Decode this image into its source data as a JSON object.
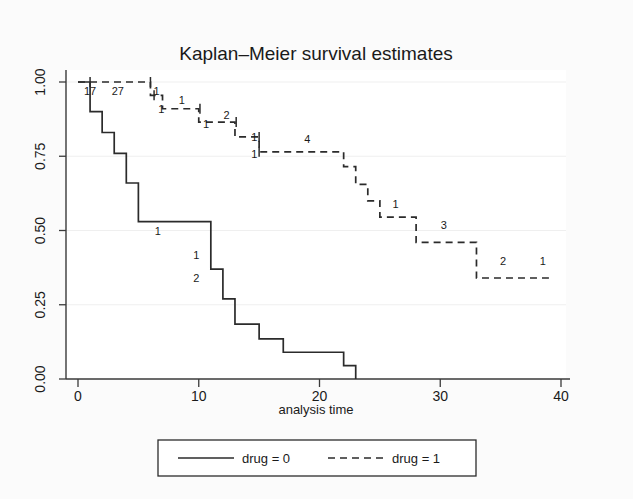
{
  "figure": {
    "background_color": "#fbfbfb",
    "plot_background_color": "#ffffff",
    "line_color": "#2b2b2b"
  },
  "chart_data": {
    "type": "line",
    "subtype": "kaplan-meier-step",
    "title": "Kaplan–Meier survival estimates",
    "xlabel": "analysis time",
    "ylabel": "",
    "xlim": [
      0,
      40
    ],
    "ylim": [
      0,
      1
    ],
    "xticks": [
      0,
      10,
      20,
      30,
      40
    ],
    "xticklabels": [
      "0",
      "10",
      "20",
      "30",
      "40"
    ],
    "yticks": [
      0.0,
      0.25,
      0.5,
      0.75,
      1.0
    ],
    "yticklabels": [
      "0.00",
      "0.25",
      "0.50",
      "0.75",
      "1.00"
    ],
    "grid": "horizontal",
    "legend_position": "below-axes",
    "series": [
      {
        "name": "drug = 0",
        "linestyle": "solid",
        "x": [
          0,
          1,
          1,
          2,
          2,
          3,
          3,
          4,
          4,
          5,
          5,
          8,
          8,
          11,
          11,
          12,
          12,
          13,
          13,
          15,
          15,
          17,
          17,
          22,
          22,
          23,
          23
        ],
        "y": [
          1.0,
          1.0,
          0.9,
          0.9,
          0.83,
          0.83,
          0.76,
          0.76,
          0.66,
          0.66,
          0.53,
          0.53,
          0.53,
          0.53,
          0.37,
          0.37,
          0.27,
          0.27,
          0.185,
          0.185,
          0.135,
          0.135,
          0.09,
          0.09,
          0.045,
          0.045,
          0.0
        ],
        "steps": [
          {
            "t": 1,
            "survival": 0.9
          },
          {
            "t": 2,
            "survival": 0.83
          },
          {
            "t": 3,
            "survival": 0.76
          },
          {
            "t": 4,
            "survival": 0.66
          },
          {
            "t": 5,
            "survival": 0.53
          },
          {
            "t": 8,
            "survival": 0.53
          },
          {
            "t": 11,
            "survival": 0.37
          },
          {
            "t": 12,
            "survival": 0.27
          },
          {
            "t": 13,
            "survival": 0.185
          },
          {
            "t": 15,
            "survival": 0.135
          },
          {
            "t": 17,
            "survival": 0.09
          },
          {
            "t": 22,
            "survival": 0.045
          },
          {
            "t": 23,
            "survival": 0.0
          }
        ]
      },
      {
        "name": "drug = 1",
        "linestyle": "dashed",
        "x": [
          0,
          6,
          6,
          7,
          7,
          10,
          10,
          13,
          13,
          15,
          15,
          16,
          16,
          22,
          22,
          23,
          23,
          24,
          24,
          25,
          25,
          28,
          28,
          33,
          33,
          39
        ],
        "y": [
          1.0,
          1.0,
          0.955,
          0.955,
          0.91,
          0.91,
          0.865,
          0.865,
          0.815,
          0.815,
          0.765,
          0.765,
          0.765,
          0.765,
          0.715,
          0.715,
          0.655,
          0.655,
          0.6,
          0.6,
          0.545,
          0.545,
          0.46,
          0.46,
          0.34,
          0.34
        ],
        "steps": [
          {
            "t": 6,
            "survival": 0.955
          },
          {
            "t": 7,
            "survival": 0.91
          },
          {
            "t": 10,
            "survival": 0.865
          },
          {
            "t": 13,
            "survival": 0.815
          },
          {
            "t": 15,
            "survival": 0.765
          },
          {
            "t": 22,
            "survival": 0.715
          },
          {
            "t": 23,
            "survival": 0.655
          },
          {
            "t": 24,
            "survival": 0.6
          },
          {
            "t": 25,
            "survival": 0.545
          },
          {
            "t": 28,
            "survival": 0.46
          },
          {
            "t": 33,
            "survival": 0.34
          }
        ]
      }
    ],
    "annotations": [
      {
        "label": "17",
        "x": 1.0,
        "y": 0.955,
        "series": "drug = 0"
      },
      {
        "label": "27",
        "x": 3.3,
        "y": 0.955,
        "series": "drug = 1"
      },
      {
        "label": "1",
        "x": 6.5,
        "y": 0.955,
        "series": "drug = 1"
      },
      {
        "label": "1",
        "x": 6.9,
        "y": 0.895,
        "series": "drug = 1"
      },
      {
        "label": "1",
        "x": 8.6,
        "y": 0.925,
        "series": "drug = 1"
      },
      {
        "label": "1",
        "x": 10.6,
        "y": 0.845,
        "series": "drug = 1"
      },
      {
        "label": "2",
        "x": 12.3,
        "y": 0.875,
        "series": "drug = 1"
      },
      {
        "label": "1",
        "x": 14.6,
        "y": 0.8,
        "series": "drug = 1"
      },
      {
        "label": "1",
        "x": 14.6,
        "y": 0.745,
        "series": "drug = 1"
      },
      {
        "label": "4",
        "x": 19.0,
        "y": 0.795,
        "series": "drug = 1"
      },
      {
        "label": "1",
        "x": 26.3,
        "y": 0.575,
        "series": "drug = 1"
      },
      {
        "label": "3",
        "x": 30.3,
        "y": 0.505,
        "series": "drug = 1"
      },
      {
        "label": "2",
        "x": 35.2,
        "y": 0.385,
        "series": "drug = 1"
      },
      {
        "label": "1",
        "x": 38.5,
        "y": 0.385,
        "series": "drug = 1"
      },
      {
        "label": "1",
        "x": 6.6,
        "y": 0.485,
        "series": "drug = 0"
      },
      {
        "label": "1",
        "x": 9.8,
        "y": 0.405,
        "series": "drug = 0"
      },
      {
        "label": "2",
        "x": 9.8,
        "y": 0.325,
        "series": "drug = 0"
      }
    ],
    "censor_marks": [
      {
        "x": 6.0,
        "y": 1.0,
        "series": "drug = 1"
      },
      {
        "x": 6.3,
        "y": 0.955,
        "series": "drug = 1"
      },
      {
        "x": 10.1,
        "y": 0.91,
        "series": "drug = 1"
      },
      {
        "x": 13.1,
        "y": 0.865,
        "series": "drug = 1"
      },
      {
        "x": 15.0,
        "y": 0.815,
        "series": "drug = 1"
      },
      {
        "x": 15.0,
        "y": 0.765,
        "series": "drug = 1"
      },
      {
        "x": 1.0,
        "y": 1.0,
        "series": "drug = 0"
      }
    ]
  },
  "legend": {
    "entries": [
      {
        "label": "drug = 0",
        "style": "solid"
      },
      {
        "label": "drug = 1",
        "style": "dashed"
      }
    ]
  }
}
